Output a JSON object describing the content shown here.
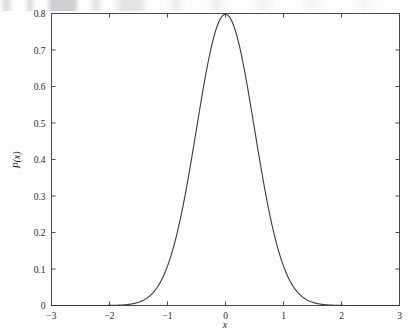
{
  "figure": {
    "background_color": "#fdfdfd",
    "curve_color": "#3a3a3a",
    "axis_color": "#4a4a4a",
    "text_color": "#2b2b2b"
  },
  "chart_data": {
    "type": "line",
    "title": "",
    "subtitle": "",
    "xlabel": "x",
    "ylabel": "P(x)",
    "xlim": [
      -3,
      3
    ],
    "ylim": [
      0,
      0.8
    ],
    "grid": false,
    "legend": null,
    "legend_position": "none",
    "annotations": [],
    "xticks": [
      -3,
      -2,
      -1,
      0,
      1,
      2,
      3
    ],
    "xticklabels": [
      "−3",
      "−2",
      "−1",
      "0",
      "1",
      "2",
      "3"
    ],
    "yticks": [
      0,
      0.1,
      0.2,
      0.3,
      0.4,
      0.5,
      0.6,
      0.7,
      0.8
    ],
    "yticklabels": [
      "0",
      "0.1",
      "0.2",
      "0.3",
      "0.4",
      "0.5",
      "0.6",
      "0.7",
      "0.8"
    ],
    "tick_direction": "in",
    "series": [
      {
        "name": "P(x)",
        "description": "Gaussian probability density, mean 0, standard deviation 0.5, peak 0.7979",
        "mean": 0,
        "sigma": 0.5,
        "peak_value": 0.8,
        "x": [
          -3.0,
          -2.8,
          -2.6,
          -2.4,
          -2.2,
          -2.0,
          -1.8,
          -1.6,
          -1.4,
          -1.2,
          -1.0,
          -0.9,
          -0.8,
          -0.7,
          -0.6,
          -0.5,
          -0.4,
          -0.3,
          -0.2,
          -0.1,
          0.0,
          0.1,
          0.2,
          0.3,
          0.4,
          0.5,
          0.6,
          0.7,
          0.8,
          0.9,
          1.0,
          1.2,
          1.4,
          1.6,
          1.8,
          2.0,
          2.2,
          2.4,
          2.6,
          2.8,
          3.0
        ],
        "values": [
          0.0,
          0.0,
          0.0,
          0.0001,
          0.0002,
          0.0006,
          0.0016,
          0.0042,
          0.0102,
          0.0224,
          0.108,
          0.162,
          0.2283,
          0.3034,
          0.3825,
          0.4839,
          0.5793,
          0.6664,
          0.7365,
          0.7821,
          0.7979,
          0.7821,
          0.7365,
          0.6664,
          0.5793,
          0.4839,
          0.3825,
          0.3034,
          0.2283,
          0.162,
          0.108,
          0.0224,
          0.0102,
          0.0042,
          0.0016,
          0.0006,
          0.0002,
          0.0001,
          0.0,
          0.0,
          0.0
        ]
      }
    ]
  },
  "axes": {
    "x_axis_label": "x",
    "y_axis_label": "P(x)",
    "x_tick_labels": [
      "−3",
      "−2",
      "−1",
      "0",
      "1",
      "2",
      "3"
    ],
    "y_tick_labels": [
      "0.8",
      "0.7",
      "0.6",
      "0.5",
      "0.4",
      "0.3",
      "0.2",
      "0.1",
      "0"
    ]
  }
}
